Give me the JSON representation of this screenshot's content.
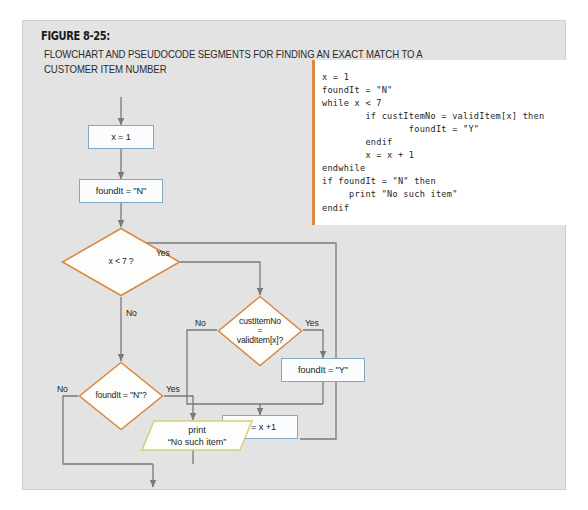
{
  "figure": {
    "number_label": "FIGURE 8-25:",
    "caption": "FLOWCHART AND PSEUDOCODE SEGMENTS FOR FINDING AN EXACT MATCH TO A CUSTOMER ITEM NUMBER"
  },
  "pseudocode": {
    "accent_color": "#d98a46",
    "text": "x = 1\nfoundIt = \"N\"\nwhile x < 7\n        if custItemNo = validItem[x] then\n                foundIt = \"Y\"\n        endif\n        x = x + 1\nendwhile\nif foundIt = \"N\" then\n     print \"No such item\"\nendif"
  },
  "flowchart": {
    "colors": {
      "process_border": "#7fa8c4",
      "decision_border": "#d98a46",
      "output_border": "#d8d07a",
      "connector": "#7a7a7a",
      "canvas": "#e3e3e3"
    },
    "process_boxes": [
      {
        "id": "set-x-1",
        "text": "x = 1"
      },
      {
        "id": "set-foundit-n",
        "text": "foundIt = \"N\""
      },
      {
        "id": "set-foundit-y",
        "text": "foundIt = \"Y\""
      },
      {
        "id": "increment-x",
        "text": "x = x +1"
      }
    ],
    "decisions": [
      {
        "id": "x-lt-7",
        "lines": [
          "x < 7 ?"
        ],
        "yes_label": "Yes",
        "no_label": "No"
      },
      {
        "id": "cust-item-match",
        "lines": [
          "custItemNo",
          "=",
          "validItem[x]?"
        ],
        "yes_label": "Yes",
        "no_label": "No"
      },
      {
        "id": "foundit-is-n",
        "lines": [
          "foundIt = \"N\"?"
        ],
        "yes_label": "Yes",
        "no_label": "No"
      }
    ],
    "outputs": [
      {
        "id": "print-no-such-item",
        "lines": [
          "print",
          "“No such item”"
        ]
      }
    ]
  }
}
